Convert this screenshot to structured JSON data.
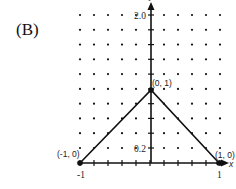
{
  "panel_label": "(B)",
  "axes": {
    "x_axis_label": "x",
    "y_axis_label": "y",
    "x_tick_labels": [
      "-1",
      "1"
    ],
    "y_tick_labels": [
      "0.2",
      "2.0"
    ]
  },
  "points": [
    {
      "label": "(-1, 0)",
      "x": -1,
      "y": 0
    },
    {
      "label": "(0, 1)",
      "x": 0,
      "y": 1
    },
    {
      "label": "(1, 0)",
      "x": 1,
      "y": 0
    }
  ],
  "graph": {
    "description": "Piecewise linear tent function through (-1, 0), (0, 1), (1, 0) drawn on a dot grid",
    "grid": "dot grid, 11 columns x 10 rows"
  },
  "colors": {
    "ink": "#111111",
    "background": "#ffffff"
  }
}
